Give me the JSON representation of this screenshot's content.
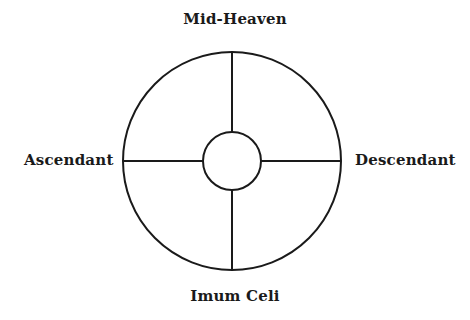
{
  "diagram": {
    "labels": {
      "top": "Mid-Heaven",
      "left": "Ascendant",
      "right": "Descendant",
      "bottom": "Imum Celi"
    },
    "geometry": {
      "center_x": 232,
      "center_y": 161,
      "outer_radius": 109,
      "inner_radius": 29
    },
    "colors": {
      "stroke": "#1a1a1a",
      "background": "#ffffff"
    }
  }
}
